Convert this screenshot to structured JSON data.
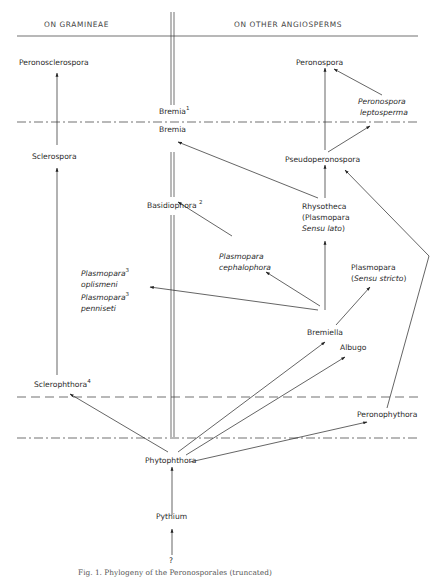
{
  "headers": {
    "left": "ON GRAMINEAE",
    "right": "ON OTHER ANGIOSPERMS"
  },
  "taxa": {
    "peronosclerospora": "Peronosclerospora",
    "sclerospora": "Sclerospora",
    "sclerophthora": "Sclerophthora",
    "sclerophthora_note": "4",
    "bremia_upper": "Bremia",
    "bremia_upper_note": "1",
    "bremia_lower": "Bremia",
    "basidiophora": "Basidiophora",
    "basidiophora_note": "2",
    "plasmopara_oplismeni_1": "Plasmopara",
    "plasmopara_oplismeni_2": "oplismeni",
    "plasmopara_oplismeni_note": "3",
    "plasmopara_penniseti_1": "Plasmopara",
    "plasmopara_penniseti_2": "penniseti",
    "plasmopara_penniseti_note": "3",
    "plasmopara_cephalophora_1": "Plasmopara",
    "plasmopara_cephalophora_2": "cephalophora",
    "peronospora": "Peronospora",
    "peronospora_leptosperma_1": "Peronospora",
    "peronospora_leptosperma_2": "leptosperma",
    "pseudoperonospora": "Pseudoperonospora",
    "rhysotheca_1": "Rhysotheca",
    "rhysotheca_2": "(Plasmopara",
    "rhysotheca_3a": "Sensu lato",
    "rhysotheca_3b": ")",
    "plasmopara_ss_1": "Plasmopara",
    "plasmopara_ss_2a": "(",
    "plasmopara_ss_2b": "Sensu stricto",
    "plasmopara_ss_2c": ")",
    "bremiella": "Bremiella",
    "albugo": "Albugo",
    "peronophythora": "Peronophythora",
    "phytophthora": "Phytophthora",
    "pythium": "Pythium",
    "origin": "?"
  },
  "caption": "Fig. 1. Phylogeny of the Peronosporales (truncated)",
  "edges": [
    {
      "from": "Sclerospora",
      "to": "Peronosclerospora"
    },
    {
      "from": "Sclerophthora",
      "to": "Sclerospora"
    },
    {
      "from": "Phytophthora",
      "to": "Sclerophthora"
    },
    {
      "from": "Pythium",
      "to": "Phytophthora"
    },
    {
      "from": "?",
      "to": "Pythium"
    },
    {
      "from": "Phytophthora",
      "to": "Bremiella"
    },
    {
      "from": "Phytophthora",
      "to": "Albugo"
    },
    {
      "from": "Phytophthora",
      "to": "Peronophythora"
    },
    {
      "from": "Peronophythora",
      "to": "Pseudoperonospora"
    },
    {
      "from": "Bremiella",
      "to": "Rhysotheca"
    },
    {
      "from": "Bremiella",
      "to": "Plasmopara (Sensu stricto)"
    },
    {
      "from": "Bremiella",
      "to": "Plasmopara cephalophora"
    },
    {
      "from": "Bremiella",
      "to": "Plasmopara oplismeni / penniseti"
    },
    {
      "from": "Plasmopara cephalophora",
      "to": "Basidiophora"
    },
    {
      "from": "Rhysotheca",
      "to": "Pseudoperonospora"
    },
    {
      "from": "Rhysotheca",
      "to": "Bremia"
    },
    {
      "from": "Pseudoperonospora",
      "to": "Peronospora"
    },
    {
      "from": "Pseudoperonospora",
      "to": "Peronospora leptosperma"
    },
    {
      "from": "Peronospora leptosperma",
      "to": "Peronospora"
    }
  ]
}
